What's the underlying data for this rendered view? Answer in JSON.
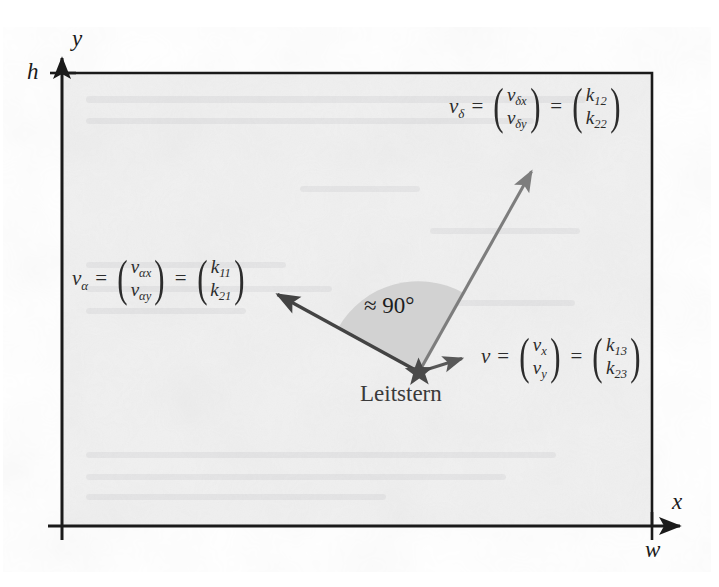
{
  "figure": {
    "name": "leitstern-vector-diagram",
    "background_color": "#ffffff",
    "plane_fill": "#f1f1f1",
    "frame_color": "#1a1a1a",
    "sector_fill": "#cfcfcf",
    "arrow_color": "#4a4a4a"
  },
  "axes": {
    "y_label": "y",
    "x_label": "x",
    "height_label": "h",
    "width_label": "w"
  },
  "star": {
    "label": "Leitstern",
    "color": "#4a4a4a"
  },
  "angle": {
    "label": "≈ 90°"
  },
  "vectors": {
    "alpha": {
      "name": "v",
      "subscript": "α",
      "equals": "=",
      "components": [
        "v",
        "v"
      ],
      "component_subs": [
        "αx",
        "αy"
      ],
      "equals2": "=",
      "values": [
        "k",
        "k"
      ],
      "value_subs": [
        "11",
        "21"
      ]
    },
    "delta": {
      "name": "v",
      "subscript": "δ",
      "equals": "=",
      "components": [
        "v",
        "v"
      ],
      "component_subs": [
        "δx",
        "δy"
      ],
      "equals2": "=",
      "values": [
        "k",
        "k"
      ],
      "value_subs": [
        "12",
        "22"
      ]
    },
    "v": {
      "name": "v",
      "subscript": "",
      "equals": "=",
      "components": [
        "v",
        "v"
      ],
      "component_subs": [
        "x",
        "y"
      ],
      "equals2": "=",
      "values": [
        "k",
        "k"
      ],
      "value_subs": [
        "13",
        "23"
      ]
    }
  },
  "diagram_data": {
    "type": "vector-diagram",
    "origin_px": [
      62,
      526
    ],
    "plane_rect_px": [
      62,
      73,
      590,
      453
    ],
    "star_px": [
      419,
      372
    ],
    "arrows": [
      {
        "id": "v-alpha",
        "from": [
          419,
          372
        ],
        "to": [
          272,
          291
        ],
        "stroke": "#4a4a4a"
      },
      {
        "id": "v-delta",
        "from": [
          419,
          372
        ],
        "to": [
          535,
          165
        ],
        "stroke": "#7d7d7d"
      },
      {
        "id": "v",
        "from": [
          419,
          372
        ],
        "to": [
          468,
          357
        ],
        "stroke": "#5a5a5a"
      }
    ],
    "sector": {
      "center": [
        419,
        372
      ],
      "radius": 92,
      "from_deg": 151,
      "to_deg": 61
    }
  }
}
